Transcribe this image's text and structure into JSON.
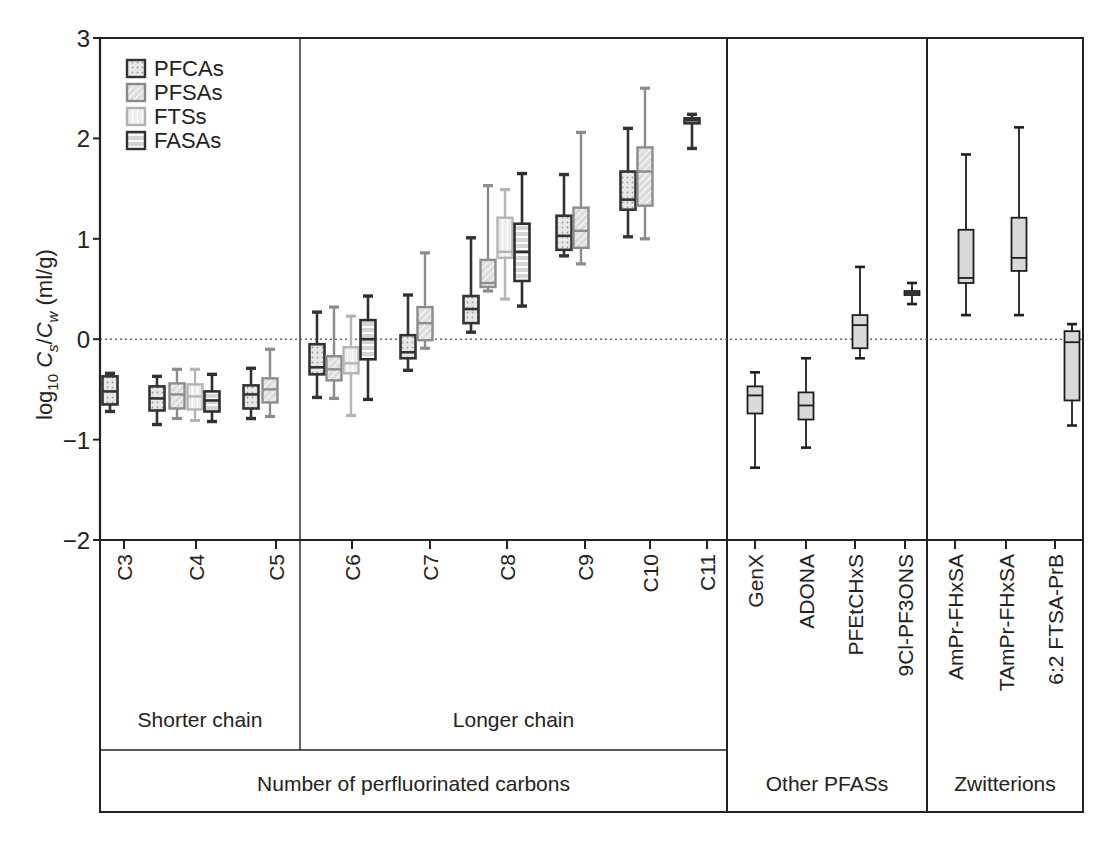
{
  "chart_data": {
    "type": "box",
    "title": "",
    "ylabel": "log10 Cs/Cw (ml/g)",
    "ylabel_parts": {
      "log": "log",
      "log_sub": "10",
      "c1": "C",
      "c1_sub": "s",
      "slash": "/",
      "c2": "C",
      "c2_sub": "w",
      "unit": " (ml/g)"
    },
    "ylim": [
      -2,
      3
    ],
    "yticks": [
      -2,
      -1,
      0,
      1,
      2,
      3
    ],
    "ytick_labels": [
      "−2",
      "−1",
      "0",
      "1",
      "2",
      "3"
    ],
    "reference_line": {
      "y": 0,
      "style": "dotted"
    },
    "legend": {
      "position": "upper-left",
      "entries": [
        {
          "name": "PFCAs",
          "pattern": "dots",
          "stroke": "#333333"
        },
        {
          "name": "PFSAs",
          "pattern": "hatch",
          "stroke": "#8a8a8a"
        },
        {
          "name": "FTSs",
          "pattern": "vlines",
          "stroke": "#b0b0b0"
        },
        {
          "name": "FASAs",
          "pattern": "hlines",
          "stroke": "#333333"
        }
      ]
    },
    "categories": [
      "C3",
      "C4",
      "C5",
      "C6",
      "C7",
      "C8",
      "C9",
      "C10",
      "C11",
      "GenX",
      "ADONA",
      "PFEtCHxS",
      "9Cl-PF3ONS",
      "AmPr-FHxSA",
      "TAmPr-FHxSA",
      "6:2 FTSA-PrB"
    ],
    "groups": [
      {
        "name": "Shorter chain",
        "categories": [
          "C3",
          "C4",
          "C5"
        ]
      },
      {
        "name": "Longer chain",
        "categories": [
          "C6",
          "C7",
          "C8",
          "C9",
          "C10",
          "C11"
        ]
      },
      {
        "name": "Other PFASs",
        "categories": [
          "GenX",
          "ADONA",
          "PFEtCHxS",
          "9Cl-PF3ONS"
        ]
      },
      {
        "name": "Zwitterions",
        "categories": [
          "AmPr-FHxSA",
          "TAmPr-FHxSA",
          "6:2 FTSA-PrB"
        ]
      }
    ],
    "supergroup": {
      "name": "Number of perfluorinated carbons",
      "groups": [
        "Shorter chain",
        "Longer chain"
      ]
    },
    "boxes": [
      {
        "category": "C3",
        "series": "PFCAs",
        "min": -0.72,
        "q1": -0.65,
        "median": -0.52,
        "q3": -0.37,
        "max": -0.34
      },
      {
        "category": "C4",
        "series": "PFCAs",
        "min": -0.85,
        "q1": -0.71,
        "median": -0.59,
        "q3": -0.47,
        "max": -0.37
      },
      {
        "category": "C4",
        "series": "PFSAs",
        "min": -0.79,
        "q1": -0.69,
        "median": -0.55,
        "q3": -0.44,
        "max": -0.3
      },
      {
        "category": "C4",
        "series": "FTSs",
        "min": -0.81,
        "q1": -0.7,
        "median": -0.57,
        "q3": -0.45,
        "max": -0.3
      },
      {
        "category": "C4",
        "series": "FASAs",
        "min": -0.82,
        "q1": -0.72,
        "median": -0.61,
        "q3": -0.52,
        "max": -0.35
      },
      {
        "category": "C5",
        "series": "PFCAs",
        "min": -0.79,
        "q1": -0.69,
        "median": -0.55,
        "q3": -0.46,
        "max": -0.29
      },
      {
        "category": "C5",
        "series": "PFSAs",
        "min": -0.77,
        "q1": -0.63,
        "median": -0.5,
        "q3": -0.39,
        "max": -0.1
      },
      {
        "category": "C6",
        "series": "PFCAs",
        "min": -0.58,
        "q1": -0.35,
        "median": -0.28,
        "q3": -0.05,
        "max": 0.27
      },
      {
        "category": "C6",
        "series": "PFSAs",
        "min": -0.59,
        "q1": -0.41,
        "median": -0.3,
        "q3": -0.17,
        "max": 0.32
      },
      {
        "category": "C6",
        "series": "FTSs",
        "min": -0.76,
        "q1": -0.34,
        "median": -0.24,
        "q3": -0.08,
        "max": 0.23
      },
      {
        "category": "C6",
        "series": "FASAs",
        "min": -0.6,
        "q1": -0.2,
        "median": 0.0,
        "q3": 0.19,
        "max": 0.43
      },
      {
        "category": "C7",
        "series": "PFCAs",
        "min": -0.31,
        "q1": -0.19,
        "median": -0.13,
        "q3": 0.04,
        "max": 0.44
      },
      {
        "category": "C7",
        "series": "PFSAs",
        "min": -0.09,
        "q1": -0.01,
        "median": 0.16,
        "q3": 0.32,
        "max": 0.86
      },
      {
        "category": "C8",
        "series": "PFCAs",
        "min": 0.07,
        "q1": 0.16,
        "median": 0.3,
        "q3": 0.43,
        "max": 1.01
      },
      {
        "category": "C8",
        "series": "PFSAs",
        "min": 0.48,
        "q1": 0.52,
        "median": 0.56,
        "q3": 0.79,
        "max": 1.53
      },
      {
        "category": "C8",
        "series": "FTSs",
        "min": 0.4,
        "q1": 0.81,
        "median": 0.87,
        "q3": 1.21,
        "max": 1.49
      },
      {
        "category": "C8",
        "series": "FASAs",
        "min": 0.33,
        "q1": 0.58,
        "median": 0.87,
        "q3": 1.15,
        "max": 1.65
      },
      {
        "category": "C9",
        "series": "PFCAs",
        "min": 0.83,
        "q1": 0.89,
        "median": 1.03,
        "q3": 1.23,
        "max": 1.64
      },
      {
        "category": "C9",
        "series": "PFSAs",
        "min": 0.75,
        "q1": 0.91,
        "median": 1.08,
        "q3": 1.31,
        "max": 2.06
      },
      {
        "category": "C10",
        "series": "PFCAs",
        "min": 1.02,
        "q1": 1.29,
        "median": 1.39,
        "q3": 1.67,
        "max": 2.1
      },
      {
        "category": "C10",
        "series": "PFSAs",
        "min": 1.0,
        "q1": 1.33,
        "median": 1.67,
        "q3": 1.91,
        "max": 2.5
      },
      {
        "category": "C11",
        "series": "PFCAs",
        "min": 1.9,
        "q1": 2.15,
        "median": 2.18,
        "q3": 2.2,
        "max": 2.24
      },
      {
        "category": "GenX",
        "series": "Other",
        "min": -1.28,
        "q1": -0.74,
        "median": -0.56,
        "q3": -0.47,
        "max": -0.33
      },
      {
        "category": "ADONA",
        "series": "Other",
        "min": -1.08,
        "q1": -0.8,
        "median": -0.66,
        "q3": -0.53,
        "max": -0.19
      },
      {
        "category": "PFEtCHxS",
        "series": "Other",
        "min": -0.19,
        "q1": -0.09,
        "median": 0.14,
        "q3": 0.24,
        "max": 0.72
      },
      {
        "category": "9Cl-PF3ONS",
        "series": "Other",
        "min": 0.35,
        "q1": 0.44,
        "median": 0.46,
        "q3": 0.48,
        "max": 0.56
      },
      {
        "category": "AmPr-FHxSA",
        "series": "Zwitterion",
        "min": 0.24,
        "q1": 0.56,
        "median": 0.61,
        "q3": 1.09,
        "max": 1.84
      },
      {
        "category": "TAmPr-FHxSA",
        "series": "Zwitterion",
        "min": 0.24,
        "q1": 0.68,
        "median": 0.81,
        "q3": 1.21,
        "max": 2.11
      },
      {
        "category": "6:2 FTSA-PrB",
        "series": "Zwitterion",
        "min": -0.86,
        "q1": -0.61,
        "median": -0.03,
        "q3": 0.08,
        "max": 0.15
      }
    ]
  },
  "layout": {
    "plot": {
      "left": 100,
      "right": 1083,
      "top": 38,
      "bottom": 540,
      "y_top_value": 3,
      "y_bottom_value": -2
    },
    "group_dividers_x": [
      300,
      727,
      927
    ],
    "label_panel": {
      "bottom": 812,
      "group_row_top": 750,
      "super_row_top": 750
    },
    "tick_x": {
      "C3": 124,
      "C4": 196,
      "C5": 276,
      "C6": 352,
      "C7": 430,
      "C8": 507,
      "C9": 585,
      "C10": 650,
      "C11": 707,
      "GenX": 755,
      "ADONA": 806,
      "PFEtCHxS": 855,
      "9Cl-PF3ONS": 905,
      "AmPr-FHxSA": 955,
      "TAmPr-FHxSA": 1006,
      "6:2 FTSA-PrB": 1055
    },
    "box_x": [
      110,
      157,
      177,
      195,
      212,
      251,
      270,
      317,
      334,
      351,
      368,
      408,
      425,
      471,
      488,
      505,
      522,
      564,
      581,
      628,
      645,
      692,
      755,
      806,
      860,
      912,
      966,
      1019,
      1072
    ],
    "box_width": 15,
    "series_style": {
      "PFCAs": {
        "stroke": "#333333",
        "fill": "#e6e6e6",
        "pattern": "dots",
        "width": 2.6
      },
      "PFSAs": {
        "stroke": "#8c8c8c",
        "fill": "#dcdcdc",
        "pattern": "hatch",
        "width": 2.4
      },
      "FTSs": {
        "stroke": "#b5b5b5",
        "fill": "#efefef",
        "pattern": "vlines",
        "width": 2.4
      },
      "FASAs": {
        "stroke": "#2e2e2e",
        "fill": "#d8d8d8",
        "pattern": "hlines",
        "width": 2.6
      },
      "Other": {
        "stroke": "#1e1e1e",
        "fill": "#d9d9d9",
        "pattern": "none",
        "width": 1.8
      },
      "Zwitterion": {
        "stroke": "#1e1e1e",
        "fill": "#d9d9d9",
        "pattern": "none",
        "width": 1.8
      }
    }
  }
}
